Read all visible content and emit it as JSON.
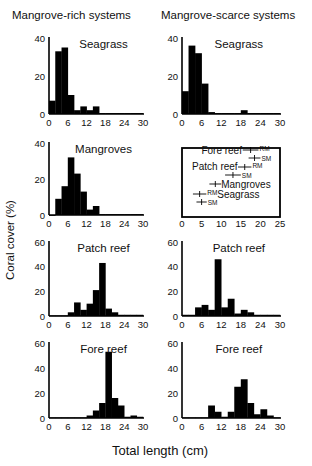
{
  "figure": {
    "column_titles": [
      "Mangrove-rich systems",
      "Mangrove-scarce systems"
    ],
    "ylabel": "Coral cover (%)",
    "xlabel": "Total length (cm)"
  },
  "chart_data": [
    {
      "type": "bar",
      "title": "Seagrass",
      "column": "Mangrove-rich systems",
      "xlabel": "Total length (cm)",
      "ylabel": "Coral cover (%)",
      "xlim": [
        0,
        30
      ],
      "ylim": [
        0,
        40
      ],
      "xticks": [
        0,
        6,
        12,
        18,
        24,
        30
      ],
      "yticks": [
        0,
        20,
        40
      ],
      "bin_width": 2,
      "bin_starts": [
        0,
        2,
        4,
        6,
        8,
        10,
        12,
        14,
        16,
        18,
        20,
        22,
        24,
        26,
        28
      ],
      "values": [
        7,
        33,
        35,
        10,
        2,
        4,
        2,
        4,
        0.5,
        0.5,
        0.5,
        0.5,
        0.5,
        0.5,
        0.5
      ]
    },
    {
      "type": "bar",
      "title": "Seagrass",
      "column": "Mangrove-scarce systems",
      "xlim": [
        0,
        30
      ],
      "ylim": [
        0,
        40
      ],
      "xticks": [
        0,
        6,
        12,
        18,
        24,
        30
      ],
      "yticks": [
        0,
        20,
        40
      ],
      "bin_width": 2,
      "bin_starts": [
        0,
        2,
        4,
        6,
        8,
        10,
        12,
        14,
        16,
        18,
        20,
        22,
        24,
        26,
        28
      ],
      "values": [
        12,
        36,
        32,
        16,
        1,
        0.5,
        0.5,
        0.5,
        0.5,
        2,
        0.5,
        0.5,
        0.5,
        0.5,
        0.5
      ]
    },
    {
      "type": "bar",
      "title": "Mangroves",
      "column": "Mangrove-rich systems",
      "xlim": [
        0,
        30
      ],
      "ylim": [
        0,
        40
      ],
      "xticks": [
        0,
        6,
        12,
        18,
        24,
        30
      ],
      "yticks": [
        0,
        20,
        40
      ],
      "bin_width": 2,
      "bin_starts": [
        0,
        2,
        4,
        6,
        8,
        10,
        12,
        14,
        16,
        18,
        20,
        22,
        24,
        26,
        28
      ],
      "values": [
        0,
        9,
        16,
        32,
        23,
        13,
        3,
        5,
        0.5,
        0.5,
        0.5,
        0.5,
        0.5,
        0.5,
        0.5
      ]
    },
    {
      "type": "scatter",
      "title": "Mean total length by habitat",
      "column": "Mangrove-scarce systems",
      "xlim": [
        0,
        25
      ],
      "xticks": [
        0,
        5,
        10,
        15,
        20,
        25
      ],
      "points": [
        {
          "label": "Fore reef",
          "series": "RM",
          "mean": 17.5,
          "err": 1.5
        },
        {
          "label": "",
          "series": "SM",
          "mean": 18.5,
          "err": 1
        },
        {
          "label": "Patch reef",
          "series": "RM",
          "mean": 16,
          "err": 1.2
        },
        {
          "label": "",
          "series": "SM",
          "mean": 13,
          "err": 1.5
        },
        {
          "label": "Mangroves",
          "series": "",
          "mean": 8.5,
          "err": 1
        },
        {
          "label": "Seagrass",
          "series": "RM",
          "mean": 4.5,
          "err": 1.2
        },
        {
          "label": "",
          "series": "SM",
          "mean": 5,
          "err": 0.8
        }
      ]
    },
    {
      "type": "bar",
      "title": "Patch reef",
      "column": "Mangrove-rich systems",
      "xlim": [
        0,
        30
      ],
      "ylim": [
        0,
        60
      ],
      "xticks": [
        0,
        6,
        12,
        18,
        24,
        30
      ],
      "yticks": [
        0,
        20,
        40,
        60
      ],
      "bin_width": 2,
      "bin_starts": [
        0,
        2,
        4,
        6,
        8,
        10,
        12,
        14,
        16,
        18,
        20,
        22,
        24,
        26,
        28
      ],
      "values": [
        0.5,
        0.5,
        0.5,
        3,
        11,
        5,
        10,
        21,
        43,
        6,
        3,
        1,
        1,
        1,
        1
      ]
    },
    {
      "type": "bar",
      "title": "Patch reef",
      "column": "Mangrove-scarce systems",
      "xlim": [
        0,
        30
      ],
      "ylim": [
        0,
        60
      ],
      "xticks": [
        0,
        6,
        12,
        18,
        24,
        30
      ],
      "yticks": [
        0,
        20,
        40,
        60
      ],
      "bin_width": 2,
      "bin_starts": [
        0,
        2,
        4,
        6,
        8,
        10,
        12,
        14,
        16,
        18,
        20,
        22,
        24,
        26,
        28
      ],
      "values": [
        1,
        1,
        7,
        9,
        5,
        46,
        7,
        14,
        2,
        5,
        3,
        1,
        1,
        1,
        1
      ]
    },
    {
      "type": "bar",
      "title": "Fore reef",
      "column": "Mangrove-rich systems",
      "xlim": [
        0,
        30
      ],
      "ylim": [
        0,
        60
      ],
      "xticks": [
        0,
        6,
        12,
        18,
        24,
        30
      ],
      "yticks": [
        0,
        20,
        40,
        60
      ],
      "bin_width": 2,
      "bin_starts": [
        0,
        2,
        4,
        6,
        8,
        10,
        12,
        14,
        16,
        18,
        20,
        22,
        24,
        26,
        28
      ],
      "values": [
        0.5,
        0.5,
        0.5,
        0.5,
        0.5,
        0.5,
        2,
        6,
        12,
        53,
        16,
        10,
        1,
        2,
        1
      ]
    },
    {
      "type": "bar",
      "title": "Fore reef",
      "column": "Mangrove-scarce systems",
      "xlim": [
        0,
        30
      ],
      "ylim": [
        0,
        60
      ],
      "xticks": [
        0,
        6,
        12,
        18,
        24,
        30
      ],
      "yticks": [
        0,
        20,
        40,
        60
      ],
      "bin_width": 2,
      "bin_starts": [
        0,
        2,
        4,
        6,
        8,
        10,
        12,
        14,
        16,
        18,
        20,
        22,
        24,
        26,
        28
      ],
      "values": [
        0.5,
        0.5,
        0.5,
        0.5,
        10,
        5,
        1,
        5,
        25,
        31,
        12,
        3,
        7,
        2,
        0.5
      ]
    }
  ]
}
